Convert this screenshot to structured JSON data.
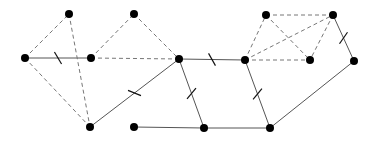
{
  "diagram": {
    "type": "graph",
    "node_color": "#000000",
    "solid_edge_color": "#555555",
    "dashed_edge_color": "#777777",
    "nodes": [
      {
        "id": "A",
        "x": 25,
        "y": 58
      },
      {
        "id": "B",
        "x": 69,
        "y": 14
      },
      {
        "id": "C",
        "x": 91,
        "y": 58
      },
      {
        "id": "D",
        "x": 134,
        "y": 14
      },
      {
        "id": "E",
        "x": 179,
        "y": 59
      },
      {
        "id": "F",
        "x": 90,
        "y": 127
      },
      {
        "id": "G",
        "x": 134,
        "y": 127
      },
      {
        "id": "H",
        "x": 245,
        "y": 60
      },
      {
        "id": "I",
        "x": 266,
        "y": 15
      },
      {
        "id": "J",
        "x": 333,
        "y": 15
      },
      {
        "id": "K",
        "x": 310,
        "y": 60
      },
      {
        "id": "L",
        "x": 354,
        "y": 61
      },
      {
        "id": "M",
        "x": 204,
        "y": 128
      },
      {
        "id": "N",
        "x": 270,
        "y": 128
      }
    ],
    "edges": [
      {
        "from": "A",
        "to": "C",
        "style": "solid",
        "tick": true
      },
      {
        "from": "E",
        "to": "F",
        "style": "solid",
        "tick": true
      },
      {
        "from": "E",
        "to": "H",
        "style": "solid",
        "tick": true
      },
      {
        "from": "E",
        "to": "M",
        "style": "solid",
        "tick": true
      },
      {
        "from": "H",
        "to": "N",
        "style": "solid",
        "tick": true
      },
      {
        "from": "J",
        "to": "L",
        "style": "solid",
        "tick": true
      },
      {
        "from": "L",
        "to": "N",
        "style": "solid",
        "tick": false
      },
      {
        "from": "G",
        "to": "M",
        "style": "solid",
        "tick": false
      },
      {
        "from": "M",
        "to": "N",
        "style": "solid",
        "tick": false
      },
      {
        "from": "A",
        "to": "B",
        "style": "dashed",
        "tick": false
      },
      {
        "from": "A",
        "to": "F",
        "style": "dashed",
        "tick": false
      },
      {
        "from": "B",
        "to": "F",
        "style": "dashed",
        "tick": false
      },
      {
        "from": "C",
        "to": "D",
        "style": "dashed",
        "tick": false
      },
      {
        "from": "D",
        "to": "E",
        "style": "dashed",
        "tick": false
      },
      {
        "from": "C",
        "to": "E",
        "style": "dashed",
        "tick": false
      },
      {
        "from": "H",
        "to": "I",
        "style": "dashed",
        "tick": false
      },
      {
        "from": "I",
        "to": "J",
        "style": "dashed",
        "tick": false
      },
      {
        "from": "H",
        "to": "J",
        "style": "dashed",
        "tick": false
      },
      {
        "from": "H",
        "to": "K",
        "style": "dashed",
        "tick": false
      },
      {
        "from": "I",
        "to": "K",
        "style": "dashed",
        "tick": false
      },
      {
        "from": "J",
        "to": "K",
        "style": "dashed",
        "tick": false
      }
    ]
  }
}
